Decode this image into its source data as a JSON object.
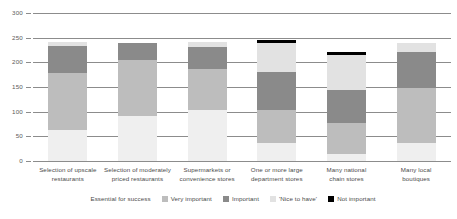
{
  "chart_data": {
    "type": "bar",
    "stacked": true,
    "title": "",
    "xlabel": "",
    "ylabel": "",
    "ylim": [
      0,
      300
    ],
    "ytick_step": 50,
    "yticks": [
      "0",
      "50",
      "100",
      "150",
      "200",
      "250",
      "300"
    ],
    "grid": true,
    "legend_position": "bottom",
    "categories": [
      "Selection of upscale restaurants",
      "Selection of moderately priced restaurants",
      "Supermarkets or convenience stores",
      "One or more large department stores",
      "Many national chain stores",
      "Many local boutiques"
    ],
    "category_lines": [
      [
        "Selection of upscale",
        "restaurants"
      ],
      [
        "Selection of moderately",
        "priced restaurants"
      ],
      [
        "Supermarkets or",
        "convenience stores"
      ],
      [
        "One or more large",
        "department stores"
      ],
      [
        "Many national",
        "chain stores"
      ],
      [
        "Many local",
        "boutiques"
      ]
    ],
    "series": [
      {
        "name": "Essential for success",
        "color": "#efefef",
        "values": [
          63,
          92,
          103,
          36,
          15,
          37
        ]
      },
      {
        "name": "Very important",
        "color": "#bdbdbd",
        "values": [
          115,
          113,
          84,
          67,
          62,
          111
        ]
      },
      {
        "name": "Important",
        "color": "#8a8a8a",
        "values": [
          55,
          35,
          44,
          77,
          68,
          72
        ]
      },
      {
        "name": "'Nice to have'",
        "color": "#e2e2e2",
        "values": [
          8,
          0,
          11,
          60,
          70,
          20
        ]
      },
      {
        "name": "Not important",
        "color": "#000000",
        "values": [
          0,
          0,
          0,
          6,
          7,
          0
        ]
      }
    ],
    "totals": [
      241,
      240,
      242,
      246,
      222,
      240
    ]
  },
  "legend": {
    "items": [
      {
        "label": "Essential for success",
        "color": "#efefef"
      },
      {
        "label": "Very important",
        "color": "#bdbdbd"
      },
      {
        "label": "Important",
        "color": "#8a8a8a"
      },
      {
        "label": "'Nice to have'",
        "color": "#e2e2e2"
      },
      {
        "label": "Not important",
        "color": "#000000"
      }
    ]
  },
  "axis": {
    "grid_color": "#8c8c8c",
    "tick_text_color": "#5a5a5a"
  }
}
